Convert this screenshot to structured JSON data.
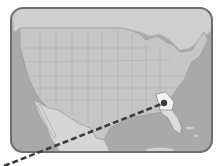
{
  "map": {
    "title": "",
    "region": "United States",
    "highlighted_state": "Georgia",
    "marker": {
      "x": 164,
      "y": 103,
      "label": ""
    },
    "colors": {
      "frame": "#6e6e6e",
      "water": "#a9a9a9",
      "land": "#c8c8c8",
      "mexico": "#d4d4d4",
      "state_border": "#b2b2b2",
      "highlight": "#f2f2f2",
      "marker": "#3a3a3a",
      "path": "#3c3c3c"
    },
    "path": {
      "style": "dashed",
      "from": [
        4,
        166
      ],
      "to": [
        164,
        103
      ]
    }
  }
}
